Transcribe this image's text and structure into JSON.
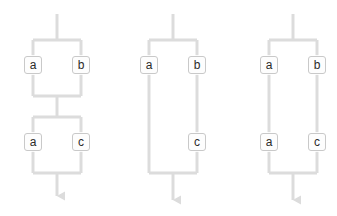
{
  "figure": {
    "background_color": "#ffffff",
    "line_color": "#d9d9d9",
    "line_color_dark": "#cfcfcf",
    "box_fill": "#fdfdfd",
    "box_border": "#c9c9c9",
    "label_color": "#2b2b2b",
    "stroke_width": 3
  },
  "diagrams": [
    {
      "id": "diagram-1",
      "name": "sequential-parallel-blocks",
      "center_x": 57,
      "blocks": [
        {
          "id": "block-1",
          "branches": [
            {
              "side": "left",
              "nodes": [
                {
                  "label": "a"
                }
              ]
            },
            {
              "side": "right",
              "nodes": [
                {
                  "label": "b"
                }
              ]
            }
          ]
        },
        {
          "id": "block-2",
          "branches": [
            {
              "side": "left",
              "nodes": [
                {
                  "label": "a"
                }
              ]
            },
            {
              "side": "right",
              "nodes": [
                {
                  "label": "c"
                }
              ]
            }
          ]
        }
      ],
      "has_entry_stem": true,
      "has_exit_arrow": true
    },
    {
      "id": "diagram-2",
      "name": "single-tall-parallel-block-uneven",
      "center_x": 170,
      "blocks": [
        {
          "id": "block-1",
          "branches": [
            {
              "side": "left",
              "nodes": [
                {
                  "label": "a"
                }
              ]
            },
            {
              "side": "right",
              "nodes": [
                {
                  "label": "b"
                },
                {
                  "label": "c"
                }
              ]
            }
          ]
        }
      ],
      "has_entry_stem": true,
      "has_exit_arrow": true
    },
    {
      "id": "diagram-3",
      "name": "single-tall-parallel-block-even",
      "center_x": 290,
      "blocks": [
        {
          "id": "block-1",
          "branches": [
            {
              "side": "left",
              "nodes": [
                {
                  "label": "a"
                },
                {
                  "label": "a"
                }
              ]
            },
            {
              "side": "right",
              "nodes": [
                {
                  "label": "b"
                },
                {
                  "label": "c"
                }
              ]
            }
          ]
        }
      ],
      "has_entry_stem": true,
      "has_exit_arrow": true
    }
  ],
  "nodes": {
    "d1_b1_left": {
      "label": "a",
      "x": 23,
      "y": 56
    },
    "d1_b1_right": {
      "label": "b",
      "x": 57,
      "y": 56
    },
    "d1_b2_left": {
      "label": "a",
      "x": 23,
      "y": 133
    },
    "d1_b2_right": {
      "label": "c",
      "x": 57,
      "y": 133
    },
    "d2_b1_left": {
      "label": "a",
      "x": 139,
      "y": 56
    },
    "d2_b1_right": {
      "label": "b",
      "x": 173,
      "y": 56
    },
    "d2_b1_right2": {
      "label": "c",
      "x": 173,
      "y": 133
    },
    "d3_b1_left": {
      "label": "a",
      "x": 259,
      "y": 56
    },
    "d3_b1_right": {
      "label": "b",
      "x": 293,
      "y": 56
    },
    "d3_b2_left": {
      "label": "a",
      "x": 259,
      "y": 133
    },
    "d3_b2_right": {
      "label": "c",
      "x": 293,
      "y": 133
    }
  }
}
